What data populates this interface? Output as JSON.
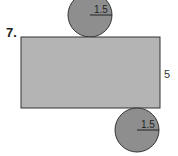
{
  "problem": {
    "number": "7.",
    "figure": "net of a cylinder",
    "top_circle": {
      "radius_label": "1.5"
    },
    "bottom_circle": {
      "radius_label": "1.5"
    },
    "rectangle": {
      "height_label": "5"
    }
  },
  "colors": {
    "rectangle_fill": "#b4b4b4",
    "circle_fill": "#8e8e8e",
    "stroke": "#333333"
  }
}
